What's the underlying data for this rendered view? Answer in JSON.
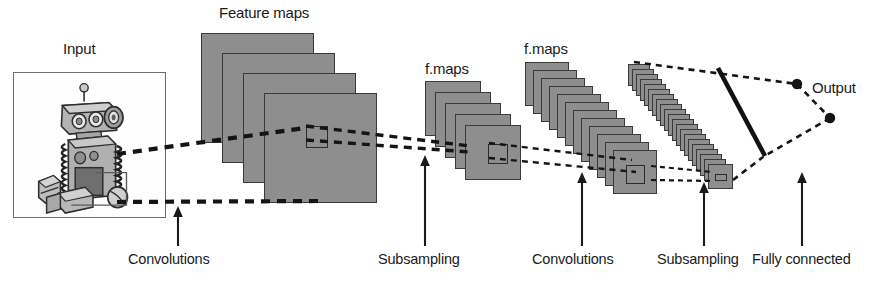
{
  "figure": {
    "title_top_labels": {
      "input": "Input",
      "feature_maps": "Feature maps",
      "fmaps_2": "f.maps",
      "fmaps_3": "f.maps",
      "output": "Output"
    },
    "bottom_labels": {
      "conv1": "Convolutions",
      "subsample1": "Subsampling",
      "conv2": "Convolutions",
      "subsample2": "Subsampling",
      "fully_connected": "Fully connected"
    },
    "colors": {
      "map_fill": "#8e8e8e",
      "map_stroke": "#3a3a3a",
      "line": "#1a1a1a",
      "text": "#1a1a1a",
      "input_frame": "#6d6d6d",
      "background": "#ffffff"
    },
    "stages": [
      {
        "name": "input",
        "label": "Input",
        "count": 1,
        "kind": "image"
      },
      {
        "name": "feature-maps-1",
        "label": "Feature maps",
        "count": 4,
        "kind": "stack"
      },
      {
        "name": "fmaps-subsample-1",
        "label": "f.maps",
        "count": 5,
        "kind": "stack"
      },
      {
        "name": "fmaps-conv-2",
        "label": "f.maps",
        "count": 13,
        "kind": "stack"
      },
      {
        "name": "fmaps-subsample-2",
        "label": "",
        "count": 22,
        "kind": "thin-stack"
      },
      {
        "name": "output",
        "label": "Output",
        "count": 2,
        "kind": "nodes"
      }
    ],
    "operations": [
      {
        "name": "conv1",
        "label": "Convolutions",
        "arrow_x": 178
      },
      {
        "name": "subsample1",
        "label": "Subsampling",
        "arrow_x": 425
      },
      {
        "name": "conv2",
        "label": "Convolutions",
        "arrow_x": 582
      },
      {
        "name": "subsample2",
        "label": "Subsampling",
        "arrow_x": 704
      },
      {
        "name": "fully_connected",
        "label": "Fully connected",
        "arrow_x": 802
      }
    ],
    "input_image_alt": "Toy robot illustration"
  }
}
